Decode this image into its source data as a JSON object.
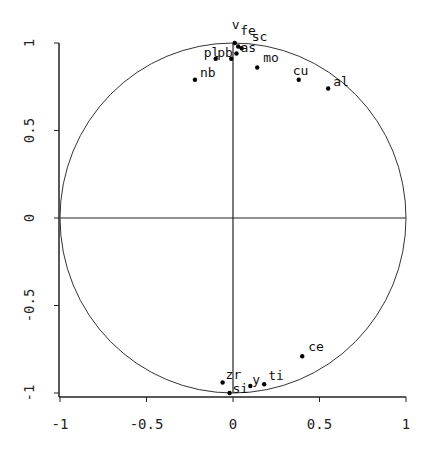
{
  "chart_data": {
    "type": "scatter",
    "title": "",
    "subtitle": "Correlation circle",
    "xlabel": "",
    "ylabel": "",
    "xlim": [
      -1,
      1
    ],
    "ylim": [
      -1,
      1
    ],
    "grid": false,
    "legend": null,
    "x_ticks": [
      "-1",
      "-0.5",
      "0",
      "0.5",
      "1"
    ],
    "y_ticks": [
      "-1",
      "-0.5",
      "0",
      "0.5",
      "1"
    ],
    "annotations": [
      "unit circle",
      "horizontal line y=0",
      "vertical line x=0"
    ],
    "points": [
      {
        "label": "v",
        "x": 0.01,
        "y": 1.0
      },
      {
        "label": "fe",
        "x": 0.03,
        "y": 0.98
      },
      {
        "label": "sc",
        "x": 0.05,
        "y": 0.97
      },
      {
        "label": "pb",
        "x": -0.01,
        "y": 0.91
      },
      {
        "label": "pl",
        "x": -0.1,
        "y": 0.91
      },
      {
        "label": "as",
        "x": 0.02,
        "y": 0.94
      },
      {
        "label": "nb",
        "x": -0.22,
        "y": 0.79
      },
      {
        "label": "mo",
        "x": 0.14,
        "y": 0.86
      },
      {
        "label": "cu",
        "x": 0.38,
        "y": 0.79
      },
      {
        "label": "al",
        "x": 0.55,
        "y": 0.74
      },
      {
        "label": "ce",
        "x": 0.4,
        "y": -0.79
      },
      {
        "label": "zr",
        "x": -0.06,
        "y": -0.94
      },
      {
        "label": "si",
        "x": -0.02,
        "y": -1.0
      },
      {
        "label": "y",
        "x": 0.1,
        "y": -0.96
      },
      {
        "label": "ti",
        "x": 0.18,
        "y": -0.95
      }
    ]
  },
  "colors": {
    "axis": "#222222",
    "circle": "#333333",
    "point": "#000000",
    "background": "#ffffff"
  }
}
